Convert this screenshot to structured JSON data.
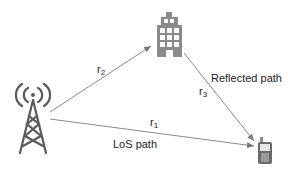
{
  "diagram": {
    "nodes": {
      "transmitter": {
        "icon": "cell-tower-icon"
      },
      "reflector": {
        "icon": "building-icon"
      },
      "receiver": {
        "icon": "mobile-phone-icon"
      }
    },
    "edges": {
      "r1": {
        "base": "r",
        "sub": "1"
      },
      "r2": {
        "base": "r",
        "sub": "2"
      },
      "r3": {
        "base": "r",
        "sub": "3"
      }
    },
    "labels": {
      "reflected_path": "Reflected path",
      "los_path": "LoS path"
    },
    "colors": {
      "line": "#8a8a8a",
      "icon": "#5a5a5a",
      "text": "#222222"
    }
  }
}
